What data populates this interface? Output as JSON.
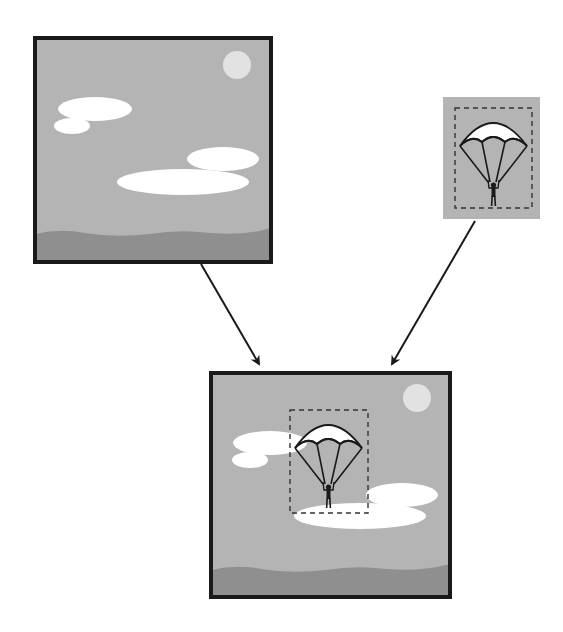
{
  "diagram": {
    "colors": {
      "background": "#ffffff",
      "sky": "#b4b4b4",
      "ground": "#8f8f8f",
      "cloud": "#ffffff",
      "sun": "#e2e2e2",
      "frame_border": "#1a1a1a",
      "outline": "#1a1a1a",
      "dashed_box": "#333333",
      "canopy_fill": "#ffffff",
      "arrow": "#1a1a1a"
    },
    "nodes": [
      {
        "id": "background-scene",
        "label": "Background image (sky, clouds, sun, ground)",
        "x": 33,
        "y": 36,
        "w": 240,
        "h": 228
      },
      {
        "id": "foreground-object",
        "label": "Foreground image (parachutist with selection box)",
        "x": 443,
        "y": 97,
        "w": 97,
        "h": 122
      },
      {
        "id": "composite-result",
        "label": "Composite image",
        "x": 209,
        "y": 371,
        "w": 243,
        "h": 228
      }
    ],
    "edges": [
      {
        "from": "background-scene",
        "to": "composite-result",
        "x1": 201,
        "y1": 264,
        "x2": 259,
        "y2": 364
      },
      {
        "from": "foreground-object",
        "to": "composite-result",
        "x1": 475,
        "y1": 221,
        "x2": 392,
        "y2": 364
      }
    ]
  }
}
